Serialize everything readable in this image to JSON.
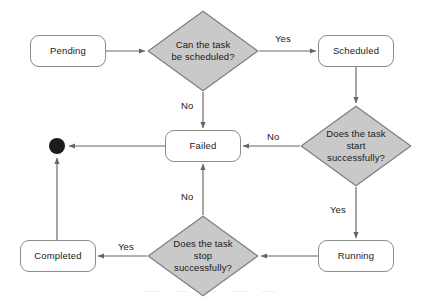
{
  "diagram": {
    "colors": {
      "background": "#ffffff",
      "box_fill": "#ffffff",
      "box_stroke": "#8c8c8c",
      "diamond_fill": "#c9c9c9",
      "diamond_stroke": "#7d7d7d",
      "edge_stroke": "#666666",
      "terminal_fill": "#1c1c1c",
      "text": "#1a1a1a"
    },
    "nodes": [
      {
        "id": "pending",
        "type": "state",
        "label": "Pending",
        "x": 30,
        "y": 35,
        "w": 76,
        "h": 32
      },
      {
        "id": "scheduled",
        "type": "state",
        "label": "Scheduled",
        "x": 318,
        "y": 35,
        "w": 76,
        "h": 32
      },
      {
        "id": "failed",
        "type": "state",
        "label": "Failed",
        "x": 165,
        "y": 130,
        "w": 76,
        "h": 32
      },
      {
        "id": "running",
        "type": "state",
        "label": "Running",
        "x": 318,
        "y": 240,
        "w": 76,
        "h": 32
      },
      {
        "id": "completed",
        "type": "state",
        "label": "Completed",
        "x": 20,
        "y": 240,
        "w": 76,
        "h": 32
      },
      {
        "id": "can_schedule",
        "type": "decision",
        "label": "Can the task\nbe scheduled?",
        "cx": 203,
        "cy": 51,
        "rx": 56,
        "ry": 41
      },
      {
        "id": "start_ok",
        "type": "decision",
        "label": "Does the task\nstart\nsuccessfully?",
        "cx": 356,
        "cy": 146,
        "rx": 56,
        "ry": 41
      },
      {
        "id": "stop_ok",
        "type": "decision",
        "label": "Does the task\nstop\nsuccessfully?",
        "cx": 203,
        "cy": 256,
        "rx": 56,
        "ry": 41
      },
      {
        "id": "end",
        "type": "terminal",
        "label": "",
        "cx": 57,
        "cy": 146,
        "r": 8
      }
    ],
    "edges": [
      {
        "id": "e-pending-decide",
        "from": "pending",
        "to": "can_schedule",
        "label": ""
      },
      {
        "id": "e-decide-scheduled",
        "from": "can_schedule",
        "to": "scheduled",
        "label": "Yes"
      },
      {
        "id": "e-decide-failed",
        "from": "can_schedule",
        "to": "failed",
        "label": "No"
      },
      {
        "id": "e-scheduled-startok",
        "from": "scheduled",
        "to": "start_ok",
        "label": ""
      },
      {
        "id": "e-startok-failed",
        "from": "start_ok",
        "to": "failed",
        "label": "No"
      },
      {
        "id": "e-startok-running",
        "from": "start_ok",
        "to": "running",
        "label": "Yes"
      },
      {
        "id": "e-running-stopok",
        "from": "running",
        "to": "stop_ok",
        "label": ""
      },
      {
        "id": "e-stopok-failed",
        "from": "stop_ok",
        "to": "failed",
        "label": "No"
      },
      {
        "id": "e-stopok-completed",
        "from": "stop_ok",
        "to": "completed",
        "label": "Yes"
      },
      {
        "id": "e-failed-end",
        "from": "failed",
        "to": "end",
        "label": ""
      },
      {
        "id": "e-completed-end",
        "from": "completed",
        "to": "end",
        "label": ""
      }
    ],
    "edge_labels": [
      {
        "id": "lbl-yes-scheduled",
        "text": "Yes",
        "x": 275,
        "y": 33
      },
      {
        "id": "lbl-no-failed-top",
        "text": "No",
        "x": 181,
        "y": 100
      },
      {
        "id": "lbl-no-startok",
        "text": "No",
        "x": 267,
        "y": 131
      },
      {
        "id": "lbl-yes-running",
        "text": "Yes",
        "x": 330,
        "y": 204
      },
      {
        "id": "lbl-no-stopok",
        "text": "No",
        "x": 181,
        "y": 191
      },
      {
        "id": "lbl-yes-completed",
        "text": "Yes",
        "x": 118,
        "y": 241
      }
    ],
    "watermark": "—  —  —  —  —"
  }
}
